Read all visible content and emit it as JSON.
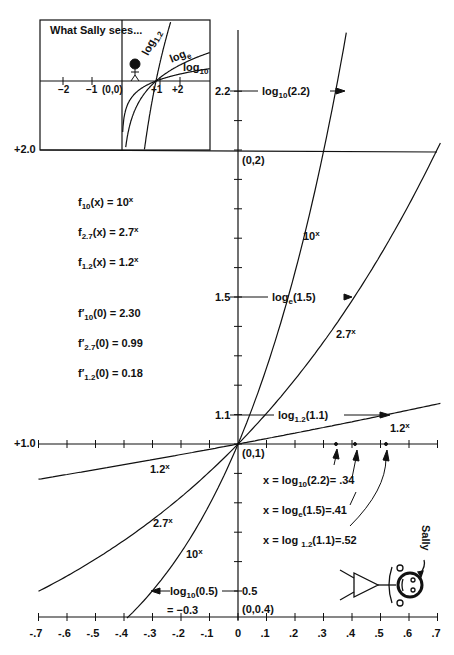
{
  "inset": {
    "title": "What Sally sees...",
    "curve_labels": {
      "log12": "log",
      "log12_sub": "1.2",
      "loge": "log",
      "loge_sub": "e",
      "log10": "log",
      "log10_sub": "10"
    },
    "ticks": [
      "−2",
      "−1",
      "(0,0)",
      "+1",
      "+2"
    ]
  },
  "axes": {
    "y_labels": {
      "y2": "+2.0",
      "y1": "+1.0",
      "y22": "2.2",
      "y15": "1.5",
      "y11": "1.1",
      "y05": "0.5"
    },
    "points": {
      "p02": "(0,2)",
      "p01": "(0,1)",
      "p004": "(0,0.4)"
    },
    "x_ticks": [
      "-.7",
      "-.6",
      "-.5",
      "-.4",
      "-.3",
      "-.2",
      "-.1",
      "0",
      ".1",
      ".2",
      ".3",
      ".4",
      ".5",
      ".6",
      ".7"
    ]
  },
  "definitions": {
    "f10": {
      "name": "f",
      "sub": "10",
      "rhs": "(x) = 10",
      "exp": "x"
    },
    "f27": {
      "name": "f",
      "sub": "2.7",
      "rhs": "(x) = 2.7",
      "exp": "x"
    },
    "f12": {
      "name": "f",
      "sub": "1.2",
      "rhs": "(x) = 1.2",
      "exp": "x"
    }
  },
  "derivatives": {
    "d10": {
      "name": "f′",
      "sub": "10",
      "rhs": "(0) = 2.30"
    },
    "d27": {
      "name": "f′",
      "sub": "2.7",
      "rhs": "(0) = 0.99"
    },
    "d12": {
      "name": "f′",
      "sub": "1.2",
      "rhs": "(0) = 0.18"
    }
  },
  "annotations": {
    "log10_22": {
      "pre": "log",
      "sub": "10",
      "post": "(2.2)"
    },
    "loge_15": {
      "pre": "log",
      "sub": "e",
      "post": "(1.5)"
    },
    "log12_11": {
      "pre": "log",
      "sub": "1.2",
      "post": "(1.1)"
    },
    "log10_05": {
      "pre": "log",
      "sub": "10",
      "post": "(0.5)"
    },
    "log10_05_val": "= −0.3",
    "res1": {
      "pre": "x = log",
      "sub": "10",
      "post": "(2.2)= .34"
    },
    "res2": {
      "pre": "x = log",
      "sub": "e",
      "post": "(1.5)=.41"
    },
    "res3": {
      "pre": "x = log ",
      "sub": "1.2",
      "post": "(1.1)=.52"
    },
    "curve10": {
      "base": "10",
      "exp": "x"
    },
    "curve27": {
      "base": "2.7",
      "exp": "x"
    },
    "curve12": {
      "base": "1.2",
      "exp": "x"
    },
    "sally": "Sally"
  },
  "chart_data": {
    "type": "line",
    "xlabel": "x",
    "ylabel": "y",
    "xlim": [
      -0.7,
      0.7
    ],
    "ylim": [
      0.4,
      2.3
    ],
    "x_ticks": [
      -0.7,
      -0.6,
      -0.5,
      -0.4,
      -0.3,
      -0.2,
      -0.1,
      0,
      0.1,
      0.2,
      0.3,
      0.4,
      0.5,
      0.6,
      0.7
    ],
    "series": [
      {
        "name": "10^x",
        "base": 10
      },
      {
        "name": "2.7^x",
        "base": 2.7
      },
      {
        "name": "1.2^x",
        "base": 1.2
      }
    ],
    "annotated_points": [
      {
        "label": "log10(2.2)",
        "x": 0.34,
        "y": 2.2
      },
      {
        "label": "loge(1.5)",
        "x": 0.41,
        "y": 1.5
      },
      {
        "label": "log1.2(1.1)",
        "x": 0.52,
        "y": 1.1
      },
      {
        "label": "log10(0.5)",
        "x": -0.3,
        "y": 0.5
      }
    ],
    "derivatives_at_0": {
      "10": 2.3,
      "2.7": 0.99,
      "1.2": 0.18
    }
  }
}
